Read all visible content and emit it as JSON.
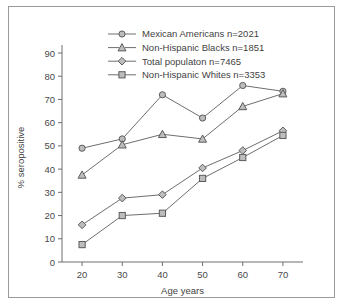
{
  "chart_data": {
    "type": "line",
    "title": "",
    "xlabel": "Age years",
    "ylabel": "% seropositive",
    "x": [
      20,
      30,
      40,
      50,
      60,
      70
    ],
    "xlim": [
      15,
      75
    ],
    "ylim": [
      0,
      90
    ],
    "xticks": [
      "20",
      "30",
      "40",
      "50",
      "60",
      "70"
    ],
    "yticks": [
      "0",
      "10",
      "20",
      "30",
      "40",
      "50",
      "60",
      "70",
      "80",
      "90"
    ],
    "grid": false,
    "legend_position": "top-center",
    "series": [
      {
        "name": "Mexican Americans n=2021",
        "marker": "circle",
        "values": [
          49,
          53,
          72,
          62,
          76,
          73.5
        ]
      },
      {
        "name": "Non-Hispanic Blacks n=1851",
        "marker": "triangle",
        "values": [
          37.5,
          50.5,
          55,
          53,
          67,
          72.5
        ]
      },
      {
        "name": "Total populaton n=7465",
        "marker": "diamond",
        "values": [
          16,
          27.5,
          29,
          40.5,
          48,
          56.5
        ]
      },
      {
        "name": "Non-Hispanic Whites n=3353",
        "marker": "square",
        "values": [
          7.5,
          20,
          21,
          36,
          45,
          54.5
        ]
      }
    ]
  },
  "legend": {
    "items": [
      {
        "label": "Mexican Americans n=2021",
        "marker": "circle"
      },
      {
        "label": "Non-Hispanic Blacks n=1851",
        "marker": "triangle"
      },
      {
        "label": "Total populaton n=7465",
        "marker": "diamond"
      },
      {
        "label": "Non-Hispanic Whites n=3353",
        "marker": "square"
      }
    ]
  },
  "colors": {
    "line": "#6e6e6e",
    "marker_fill": "#bdbdbd",
    "marker_stroke": "#5c5c5c",
    "text": "#3f3f3f",
    "frame": "#9a9a9a",
    "background": "#ffffff"
  }
}
